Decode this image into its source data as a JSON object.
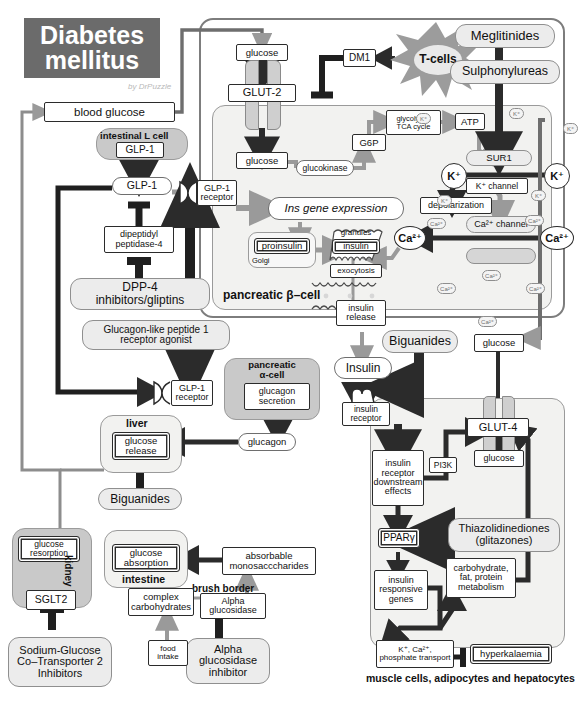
{
  "title": {
    "line1": "Diabetes",
    "line2": "mellitus",
    "signature": "by DrPuzzle"
  },
  "caption": {
    "muscle": "muscle cells, adipocytes and hepatocytes"
  },
  "colors": {
    "title_bg": "#6b6b6b",
    "cell_fill": "#f2f2f0",
    "cell_dark": "#c9c9c9",
    "drug_pill": "#ececec",
    "arrow_dark": "#2b2b2b",
    "arrow_grey": "#9a9a9a"
  },
  "nodes": {
    "blood_glucose": "blood glucose",
    "glucose_out": "glucose",
    "glut2": "GLUT-2",
    "glucose_in": "glucose",
    "glucokinase": "glucokinase",
    "g6p": "G6P",
    "glycolysis": "glycolysis,\nTCA cycle",
    "atp": "ATP",
    "sur1": "SUR1",
    "k_channel": "K⁺ channel",
    "depolarization": "depolarization",
    "ca_channel": "Ca²⁺ channel",
    "ins_gene": "Ins gene expression",
    "proinsulin": "proinsulin",
    "golgi": "Golgi",
    "granules": "granules",
    "insulin_granule": "insulin",
    "exocytosis": "exocytosis",
    "insulin_release": "insulin\nrelease",
    "insulin": "Insulin",
    "glucose_periph": "glucose",
    "glut4": "GLUT-4",
    "glucose_muscle": "glucose",
    "insulin_receptor": "insulin\nreceptor",
    "ir_downstream": "insulin\nreceptor\ndownstream\neffects",
    "pi3k": "PI3K",
    "ppar": "PPARγ",
    "insulin_genes": "insulin\nresponsive\ngenes",
    "carb_metab": "carbohydrate,\nfat, protein\nmetabolism",
    "k_ca_phos": "K⁺, Ca²⁺,\nphosphate transport",
    "hyperkalaemia": "hyperkalaemia",
    "dm1": "DM1",
    "tcells": "T-cells",
    "intestinal_l_cell": "intestinal L cell",
    "glp1_cell": "GLP-1",
    "glp1_free": "GLP-1",
    "dpp4_enzyme": "dipeptidyl\npeptidase-4",
    "glp1_receptor_beta": "GLP-1\nreceptor",
    "glp1_receptor_alpha": "GLP-1\nreceptor",
    "pancreatic_alpha": "pancreatic\nα-cell",
    "glucagon_secretion": "glucagon\nsecretion",
    "glucagon": "glucagon",
    "liver": "liver",
    "glucose_release": "glucose\nrelease",
    "intestine": "intestine",
    "glucose_absorption": "glucose\nabsorption",
    "absorbable_mono": "absorbable\nmonosacccharides",
    "brush_border": "brush border",
    "alpha_glucosidase": "Alpha\nglucosidase",
    "complex_carbs": "complex\ncarbohydrates",
    "food_intake": "food\nintake",
    "kidney": "kidney",
    "glucose_resorption": "glucose\nresorption",
    "sglt2": "SGLT2",
    "pancreatic_beta": "pancreatic β–cell",
    "ca_left": "Ca²⁺",
    "ca_right": "Ca²⁺",
    "k_left": "K⁺",
    "k_right": "K⁺"
  },
  "drugs": {
    "meglitinides": "Meglitinides",
    "sulphonylureas": "Sulphonylureas",
    "biguanides_liver": "Biguanides",
    "biguanides_intestine": "Biguanides",
    "biguanides_muscle": "Biguanides",
    "dpp4_inhibitors": "DPP-4\ninhibitors/gliptins",
    "glp1_agonist": "Glucagon-like peptide 1\nreceptor agonist",
    "thiazolidinediones": "Thiazolidinediones\n(glitazones)",
    "sglt2_inhibitors": "Sodium-Glucose\nCo–Transporter 2\nInhibitors",
    "alpha_glucosidase_inhibitor": "Alpha\nglucosidase\ninhibitor"
  },
  "ions": {
    "k": "K⁺",
    "ca": "Ca²⁺"
  }
}
